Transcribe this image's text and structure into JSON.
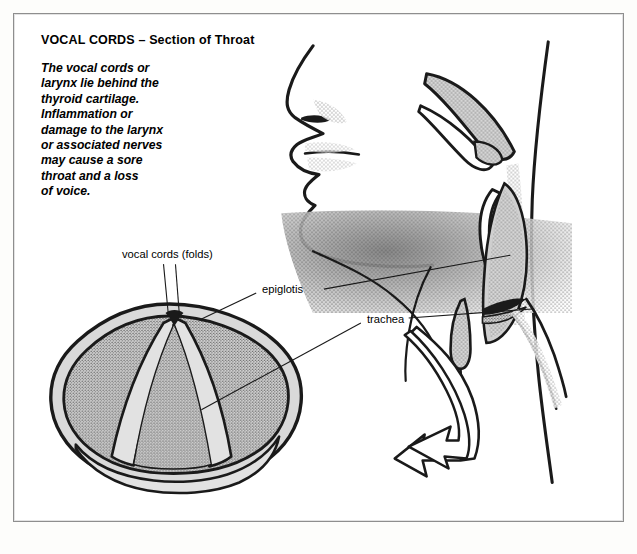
{
  "page": {
    "background_color": "#fdfdfb",
    "frame_border_color": "#8e8e8e"
  },
  "header": {
    "title": "VOCAL CORDS – Section of Throat"
  },
  "description": {
    "lines": [
      "The vocal cords or",
      "larynx lie behind the",
      "thyroid cartilage.",
      "Inflammation or",
      "damage to the larynx",
      "or associated nerves",
      "may cause a sore",
      "throat and a loss",
      "of voice."
    ]
  },
  "labels": {
    "vocal_cords": "vocal cords (folds)",
    "epiglotis": "epiglotis",
    "trachea": "trachea"
  },
  "illustration": {
    "colors": {
      "ink": "#1a1a1a",
      "tissue_fill": "#d8d8d8",
      "tissue_light": "#e8e8e8",
      "stipple": "#2a2a2a",
      "white": "#ffffff"
    },
    "parts": [
      "face-profile",
      "soft-palate",
      "epiglottis-flap",
      "pharynx-cavity",
      "larynx",
      "trachea-tube",
      "hyoid-cartilage",
      "vocal-cords-superior-view",
      "connector-arrow"
    ]
  }
}
